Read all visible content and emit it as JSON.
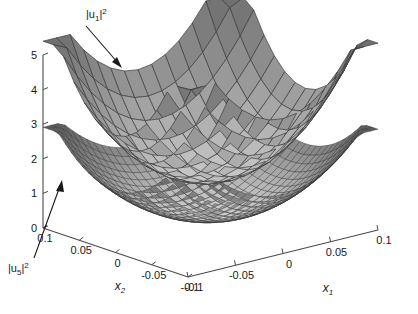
{
  "chart_data": {
    "type": "surface",
    "title": "",
    "background": "#ffffff",
    "axes": {
      "x1": {
        "label": "x_1",
        "label_text": "x",
        "label_sub": "1",
        "ticks": [
          "-0.1",
          "-0.05",
          "0",
          "0.05",
          "0.1"
        ],
        "range": [
          -0.1,
          0.1
        ]
      },
      "x2": {
        "label": "x_2",
        "label_text": "x",
        "label_sub": "2",
        "ticks": [
          "0.1",
          "0.05",
          "0",
          "-0.05",
          "-0.1"
        ],
        "range": [
          -0.1,
          0.1
        ]
      },
      "z": {
        "label": "",
        "ticks": [
          "0",
          "1",
          "2",
          "3",
          "4",
          "5"
        ],
        "range": [
          0,
          5
        ]
      }
    },
    "series": [
      {
        "name": "|u1|^2",
        "label_base": "|u",
        "label_sub": "1",
        "label_sup": "2",
        "annotation_position": "upper-left",
        "surface": "upper",
        "description": "upper paraboloid bowl, coarse mesh",
        "z_at_corner": 4.6,
        "z_min": 1.4,
        "fill_light": "#c8c8c8",
        "fill_mid": "#9a9a9a",
        "fill_dark": "#6f6f6f",
        "mesh_color": "#3c3c3c",
        "mesh_divisions": 14
      },
      {
        "name": "|u5|^2",
        "label_base": "|u",
        "label_sub": "5",
        "label_sup": "2",
        "annotation_position": "lower-left",
        "surface": "lower",
        "description": "lower paraboloid bowl, fine mesh",
        "z_at_corner": 2.4,
        "z_min": 0.35,
        "fill_light": "#cfcfcf",
        "fill_mid": "#8d8d8d",
        "fill_dark": "#5e5e5e",
        "mesh_color": "#2e2e2e",
        "mesh_divisions": 26
      }
    ],
    "annotations": [
      {
        "text": "|u1|^2",
        "target": "upper surface",
        "arrow": "down-right"
      },
      {
        "text": "|u5|^2",
        "target": "lower surface",
        "arrow": "up-right"
      }
    ],
    "colors": {
      "axis": "#4a4a4a",
      "text": "#1a1a1a",
      "background": "#ffffff"
    }
  }
}
